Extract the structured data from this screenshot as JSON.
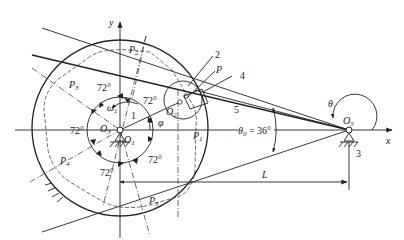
{
  "diagram": {
    "type": "mechanism-schematic",
    "axes": {
      "x_label": "x",
      "y_label": "y"
    },
    "joints": [
      {
        "id": "O1",
        "label": "O",
        "sub": "1"
      },
      {
        "id": "O2",
        "label": "O",
        "sub": "2"
      },
      {
        "id": "O3",
        "label": "O",
        "sub": "3"
      },
      {
        "id": "O5",
        "label": "O",
        "sub": "5"
      }
    ],
    "points": [
      {
        "id": "P",
        "label": "P"
      },
      {
        "id": "P1",
        "label": "P",
        "sub": "1"
      },
      {
        "id": "P2",
        "label": "P",
        "sub": "2"
      },
      {
        "id": "P3",
        "label": "P",
        "sub": "3"
      },
      {
        "id": "P4",
        "label": "P",
        "sub": "4"
      },
      {
        "id": "P5",
        "label": "P",
        "sub": "5"
      }
    ],
    "links": [
      {
        "id": "1",
        "label": "1"
      },
      {
        "id": "2",
        "label": "2"
      },
      {
        "id": "3",
        "label": "3"
      },
      {
        "id": "4",
        "label": "4"
      },
      {
        "id": "5",
        "label": "5"
      }
    ],
    "angles": {
      "segment_angle": "72°",
      "segment_count": 5,
      "theta": "θ",
      "phi": "φ",
      "omega": "ω",
      "omega_sub": "1",
      "theta0_label": "θ",
      "theta0_sub": "0",
      "theta0_value": " = 36°"
    },
    "dimension": {
      "label": "L"
    }
  }
}
